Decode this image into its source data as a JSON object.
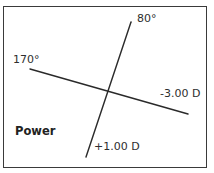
{
  "diagram": {
    "title_label": "Power",
    "meridians": [
      {
        "id": "axis-80",
        "angle_label": "80°",
        "power_label": "+1.00 D",
        "line": {
          "x1": 131,
          "y1": 22,
          "x2": 86,
          "y2": 157
        }
      },
      {
        "id": "axis-170",
        "angle_label": "170°",
        "power_label": "-3.00 D",
        "line": {
          "x1": 30,
          "y1": 69,
          "x2": 188,
          "y2": 114
        }
      }
    ],
    "colors": {
      "line": "#2a2a2a",
      "border": "#3a3a3a",
      "background": "#ffffff"
    }
  }
}
